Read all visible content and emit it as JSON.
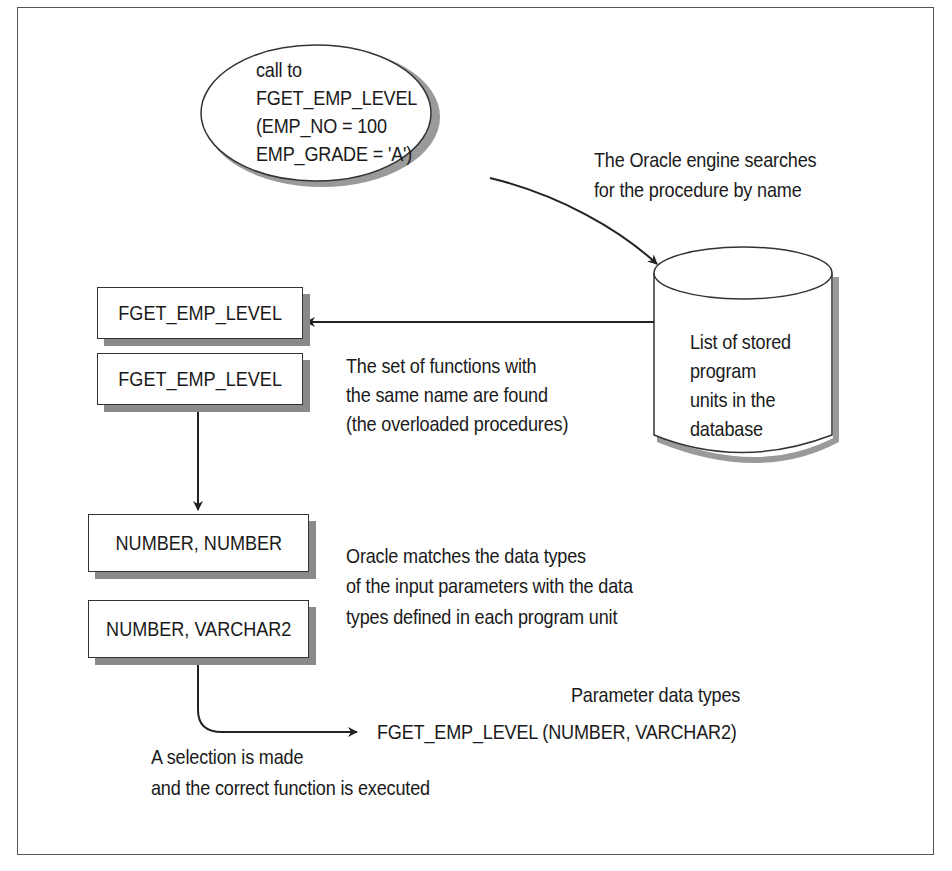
{
  "diagram": {
    "call_bubble": {
      "lines": [
        "call to",
        "FGET_EMP_LEVEL",
        "(EMP_NO = 100",
        "EMP_GRADE = 'A')"
      ]
    },
    "search_note": {
      "lines": [
        "The Oracle engine searches",
        "for the procedure by name"
      ]
    },
    "database": {
      "lines": [
        "List of stored",
        "program",
        "units in the",
        "database"
      ]
    },
    "found_boxes": [
      "FGET_EMP_LEVEL",
      "FGET_EMP_LEVEL"
    ],
    "found_note": {
      "lines": [
        "The set of functions with",
        "the same name are found",
        "(the overloaded procedures)"
      ]
    },
    "type_boxes": [
      "NUMBER,  NUMBER",
      "NUMBER, VARCHAR2"
    ],
    "match_note": {
      "lines": [
        "Oracle matches the data types",
        "of the input parameters with the data",
        "types defined in each program unit"
      ]
    },
    "param_label": "Parameter data types",
    "result_signature": "FGET_EMP_LEVEL (NUMBER, VARCHAR2)",
    "selection_note": {
      "lines": [
        "A selection is made",
        "and the correct function is executed"
      ]
    },
    "colors": {
      "line": "#222222",
      "shadow": "#8a8a8a",
      "frame": "#555555"
    }
  }
}
